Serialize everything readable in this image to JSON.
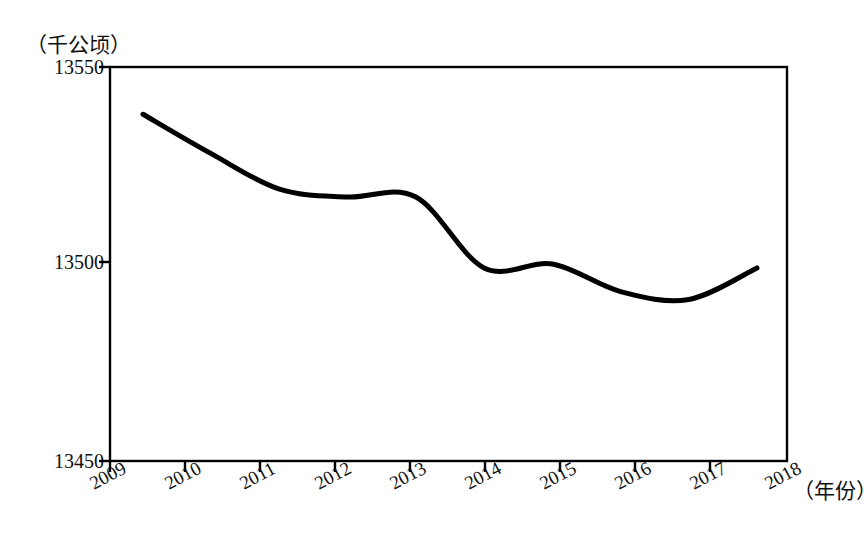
{
  "chart_data": {
    "type": "line",
    "title": "",
    "subtitle": "",
    "xlabel": "（年份）",
    "ylabel": "（千公顷）",
    "unit_label": "（千公顷）",
    "x_unit_label": "（年份）",
    "categories": [
      "2009",
      "2010",
      "2011",
      "2012",
      "2013",
      "2014",
      "2015",
      "2016",
      "2017",
      "2018"
    ],
    "values": [
      13538,
      13528,
      13519,
      13517,
      13517,
      13499,
      13500,
      13493,
      13491,
      13499
    ],
    "series": [
      {
        "name": "",
        "values": [
          13538,
          13528,
          13519,
          13517,
          13517,
          13499,
          13500,
          13493,
          13491,
          13499
        ]
      }
    ],
    "y_ticks": [
      13450,
      13500,
      13550
    ],
    "y_tick_labels": [
      "13450",
      "13500",
      "13550"
    ],
    "ylim": [
      13450,
      13550
    ],
    "xlim": [
      "2009",
      "2018"
    ],
    "grid": false,
    "legend": false,
    "legend_position": "none",
    "line_color": "#000000",
    "line_width": 5,
    "axis_color": "#000000",
    "background_color": "#ffffff"
  },
  "axes": {
    "y_labels": [
      {
        "text": "13550",
        "top": 56
      },
      {
        "text": "13500",
        "top": 251
      },
      {
        "text": "13450",
        "top": 450
      }
    ],
    "x_labels": [
      {
        "text": "2009",
        "left": 86,
        "top": 475
      },
      {
        "text": "2010",
        "left": 161,
        "top": 475
      },
      {
        "text": "2011",
        "left": 236,
        "top": 475
      },
      {
        "text": "2012",
        "left": 311,
        "top": 475
      },
      {
        "text": "2013",
        "left": 386,
        "top": 475
      },
      {
        "text": "2014",
        "left": 461,
        "top": 475
      },
      {
        "text": "2015",
        "left": 536,
        "top": 475
      },
      {
        "text": "2016",
        "left": 611,
        "top": 475
      },
      {
        "text": "2017",
        "left": 686,
        "top": 475
      },
      {
        "text": "2018",
        "left": 761,
        "top": 475
      }
    ]
  }
}
